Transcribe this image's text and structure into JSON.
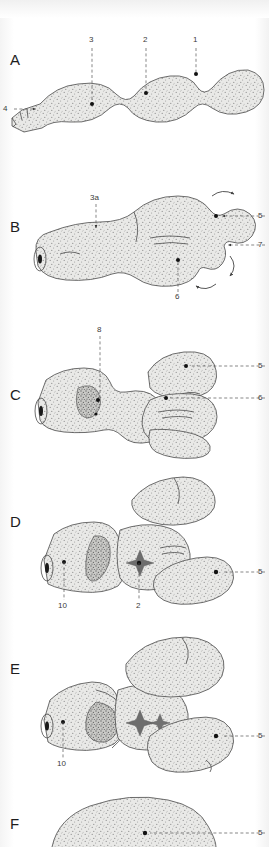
{
  "figure": {
    "type": "scientific-illustration",
    "panel_count": 6,
    "style": "stippled pen-and-ink anatomical drawing",
    "colors": {
      "background": "#fdfdfd",
      "ink": "#4a4a4a",
      "stipple": "#8a8a8a",
      "fill": "#e8e8e6",
      "label_text": "#3a3a3a",
      "panel_letter": "#1d1d1d",
      "leader_line": "#555555",
      "marker_dot": "#111111"
    }
  },
  "panels": [
    {
      "letter": "A",
      "labels": [
        {
          "id": "a3",
          "text": "3"
        },
        {
          "id": "a2",
          "text": "2"
        },
        {
          "id": "a1",
          "text": "1"
        },
        {
          "id": "a4",
          "text": "4"
        }
      ]
    },
    {
      "letter": "B",
      "labels": [
        {
          "id": "b3a",
          "text": "3a"
        },
        {
          "id": "b5",
          "text": "5"
        },
        {
          "id": "b7",
          "text": "7"
        },
        {
          "id": "b6",
          "text": "6"
        }
      ],
      "annotations": [
        "rotation-arrow-upper",
        "rotation-arrow-right",
        "rotation-arrow-lower"
      ]
    },
    {
      "letter": "C",
      "labels": [
        {
          "id": "c8",
          "text": "8"
        },
        {
          "id": "c5",
          "text": "5"
        },
        {
          "id": "c6",
          "text": "6"
        }
      ]
    },
    {
      "letter": "D",
      "labels": [
        {
          "id": "d10",
          "text": "10"
        },
        {
          "id": "d2",
          "text": "2"
        },
        {
          "id": "d5",
          "text": "5"
        }
      ]
    },
    {
      "letter": "E",
      "labels": [
        {
          "id": "e10",
          "text": "10"
        },
        {
          "id": "e5",
          "text": "5"
        }
      ]
    },
    {
      "letter": "F",
      "labels": [
        {
          "id": "f5",
          "text": "5"
        }
      ]
    }
  ]
}
